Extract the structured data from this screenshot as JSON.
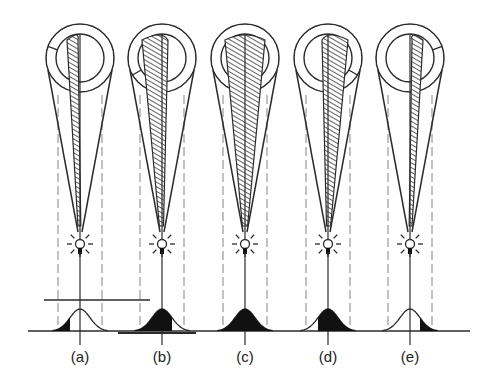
{
  "figure": {
    "colors": {
      "line": "#2b2b2b",
      "dashed": "#9a9a9a",
      "hatch": "#3a3a3a",
      "fill": "#111111",
      "background": "#ffffff"
    },
    "panels": [
      {
        "id": "a",
        "label": "(a)",
        "cx": 80,
        "hatch": "left-narrow",
        "profile_fill": "left-tail",
        "ref_line": true
      },
      {
        "id": "b",
        "label": "(b)",
        "cx": 162,
        "hatch": "left-wide",
        "profile_fill": "left-major",
        "ref_line": false
      },
      {
        "id": "c",
        "label": "(c)",
        "cx": 245,
        "hatch": "full",
        "profile_fill": "full",
        "ref_line": false
      },
      {
        "id": "d",
        "label": "(d)",
        "cx": 328,
        "hatch": "right-wide",
        "profile_fill": "right-major",
        "ref_line": false
      },
      {
        "id": "e",
        "label": "(e)",
        "cx": 410,
        "hatch": "right-narrow",
        "profile_fill": "right-tail",
        "ref_line": false
      }
    ]
  }
}
